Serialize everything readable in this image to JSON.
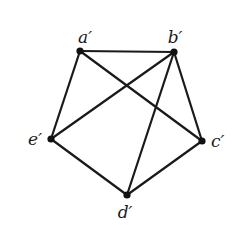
{
  "diagram": {
    "type": "graph",
    "nodes": [
      {
        "id": "a",
        "label": "a′",
        "x": 80,
        "y": 51,
        "lx": 85,
        "ly": 43,
        "anchor": "middle"
      },
      {
        "id": "b",
        "label": "b′",
        "x": 174,
        "y": 52,
        "lx": 175,
        "ly": 43,
        "anchor": "middle"
      },
      {
        "id": "c",
        "label": "c′",
        "x": 202,
        "y": 141,
        "lx": 211,
        "ly": 147,
        "anchor": "start"
      },
      {
        "id": "d",
        "label": "d′",
        "x": 127,
        "y": 195,
        "lx": 125,
        "ly": 218,
        "anchor": "middle"
      },
      {
        "id": "e",
        "label": "e′",
        "x": 51,
        "y": 139,
        "lx": 42,
        "ly": 145,
        "anchor": "end"
      }
    ],
    "edges": [
      [
        "a",
        "b"
      ],
      [
        "a",
        "e"
      ],
      [
        "a",
        "c"
      ],
      [
        "b",
        "e"
      ],
      [
        "b",
        "d"
      ],
      [
        "b",
        "c"
      ],
      [
        "e",
        "d"
      ],
      [
        "c",
        "d"
      ]
    ]
  }
}
